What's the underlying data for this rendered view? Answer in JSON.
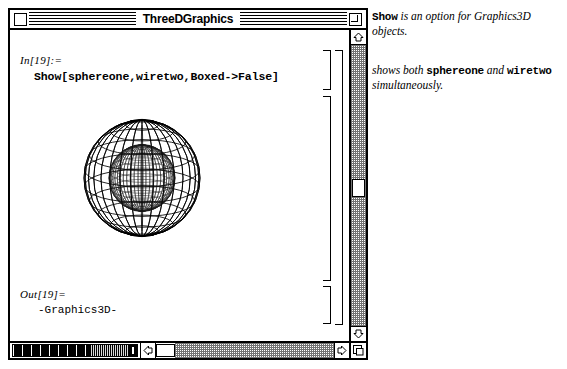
{
  "window": {
    "title": "ThreeDGraphics",
    "close_box": "close-box",
    "zoom_box": "zoom-box",
    "grow_box": "grow-box"
  },
  "notebook": {
    "cells": [
      {
        "type": "input",
        "label": "In[19]:=",
        "code": "Show[sphereone,wiretwo,Boxed->False]"
      },
      {
        "type": "graphics",
        "label": "",
        "code": ""
      },
      {
        "type": "output",
        "label": "Out[19]=",
        "code": "-Graphics3D-"
      }
    ]
  },
  "graphics": {
    "name": "three-d-graphics-spheres",
    "description": "Two concentric wireframe spheres rendered in 3D",
    "outer_sphere": {
      "name": "wiretwo",
      "style": "coarse wireframe",
      "meridians": 16,
      "parallels": 11,
      "radius": 58,
      "color": "#000000"
    },
    "inner_sphere": {
      "name": "sphereone",
      "style": "dense mesh",
      "meridians": 26,
      "parallels": 18,
      "radius": 33,
      "color": "#1a1a1a"
    },
    "boxed": "False"
  },
  "scrollbars": {
    "vertical": {
      "up_arrow": "▲",
      "down_arrow": "▼",
      "thumb_position_percent": 50
    },
    "horizontal": {
      "left_arrow": "◀",
      "right_arrow": "▶",
      "thumb_position_percent": 2
    }
  },
  "magnifier": {
    "label": "magnification-slider",
    "value_percent": 62
  },
  "annotations": [
    {
      "id": "show-option",
      "segments": [
        {
          "style": "mono",
          "text": "Show"
        },
        {
          "style": "italic",
          "text": " is an option for Graphics3D objects."
        }
      ]
    },
    {
      "id": "shows-both",
      "segments": [
        {
          "style": "italic",
          "text": "shows both "
        },
        {
          "style": "mono",
          "text": "sphereone"
        },
        {
          "style": "italic",
          "text": " and "
        },
        {
          "style": "mono",
          "text": "wiretwo"
        },
        {
          "style": "italic",
          "text": " simultaneously."
        }
      ]
    }
  ],
  "colors": {
    "ink": "#000000",
    "paper": "#ffffff",
    "chrome": "#ffffff"
  }
}
